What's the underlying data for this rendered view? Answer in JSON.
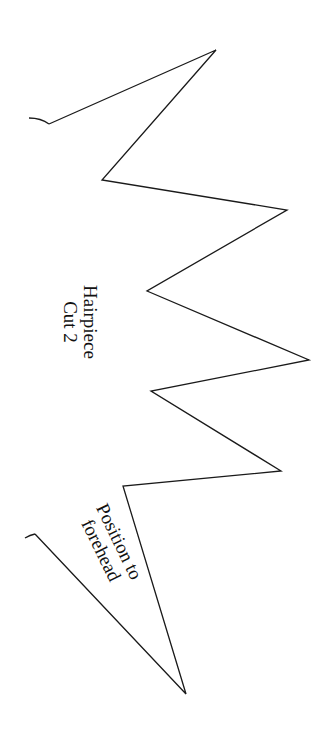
{
  "pattern": {
    "title": "Hairpiece",
    "instruction": "Cut 2",
    "placement_note_line1": "Position to",
    "placement_note_line2": "forehead",
    "stroke_color": "#1a1a1a",
    "background_color": "#ffffff",
    "outline_points": [
      [
        49,
        124
      ],
      [
        216,
        50
      ],
      [
        102,
        180
      ],
      [
        287,
        210
      ],
      [
        147,
        291
      ],
      [
        309,
        360
      ],
      [
        151,
        391
      ],
      [
        281,
        471
      ],
      [
        123,
        486
      ],
      [
        186,
        694
      ],
      [
        35,
        534
      ]
    ],
    "top_hook": {
      "from": [
        29,
        118
      ],
      "to": [
        49,
        124
      ]
    },
    "bottom_hook": {
      "from": [
        35,
        534
      ],
      "to": [
        25,
        538
      ]
    }
  }
}
